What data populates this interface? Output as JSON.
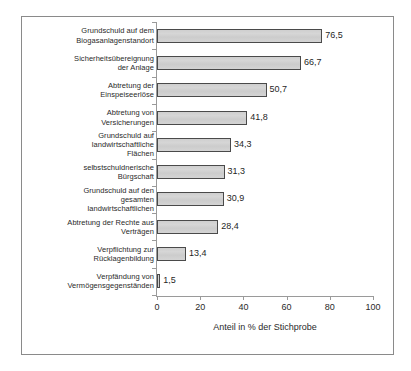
{
  "chart_data": {
    "type": "bar",
    "orientation": "horizontal",
    "title": "",
    "xlabel": "Anteil in % der Stichprobe",
    "ylabel": "",
    "xlim": [
      0,
      100
    ],
    "xticks": [
      "0",
      "20",
      "40",
      "60",
      "80",
      "100"
    ],
    "grid": false,
    "legend": "none",
    "value_label_format": "comma-decimal",
    "categories": [
      "Grundschuld auf dem Biogasanlagenstandort",
      "Sicherheitsübereignung der Anlage",
      "Abtretung der Einspeiseerlöse",
      "Abtretung von Versicherungen",
      "Grundschuld auf landwirtschaftliche Flächen",
      "selbstschuldnerische Bürgschaft",
      "Grundschuld auf den gesamten landwirtschaftlichen",
      "Abtretung der Rechte aus Verträgen",
      "Verpflichtung zur Rücklagenbildung",
      "Verpfändung von Vermögensgegenständen"
    ],
    "category_lines": [
      [
        "Grundschuld auf dem",
        "Biogasanlagenstandort"
      ],
      [
        "Sicherheitsübereignung",
        "der Anlage"
      ],
      [
        "Abtretung der",
        "Einspeiseerlöse"
      ],
      [
        "Abtretung von",
        "Versicherungen"
      ],
      [
        "Grundschuld auf",
        "landwirtschaftliche",
        "Flächen"
      ],
      [
        "selbstschuldnerische",
        "Bürgschaft"
      ],
      [
        "Grundschuld auf den",
        "gesamten",
        "landwirtschaftlichen"
      ],
      [
        "Abtretung der Rechte aus",
        "Verträgen"
      ],
      [
        "Verpflichtung zur",
        "Rücklagenbildung"
      ],
      [
        "Verpfändung von",
        "Vermögensgegenständen"
      ]
    ],
    "values": [
      76.5,
      66.7,
      50.7,
      41.8,
      34.3,
      31.3,
      30.9,
      28.4,
      13.4,
      1.5
    ],
    "value_labels": [
      "76,5",
      "66,7",
      "50,7",
      "41,8",
      "34,3",
      "31,3",
      "30,9",
      "28,4",
      "13,4",
      "1,5"
    ],
    "colors": {
      "bar_fill": "#d2d2d2",
      "bar_stroke": "#4a4a4a",
      "axis": "#9a9a9a",
      "frame": "#8a8a8a",
      "text": "#2a2a2a",
      "background": "#ffffff"
    }
  }
}
